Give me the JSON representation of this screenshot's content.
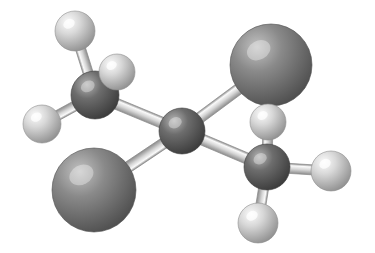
{
  "image": {
    "kind": "ball-and-stick-molecular-model",
    "title": "Ball-and-stick molecular model",
    "width": 375,
    "height": 253,
    "background_color": "#ffffff",
    "render_style": "shaded-spheres-with-cylinder-bonds",
    "light_direction": "upper-left"
  },
  "palette": {
    "background": "#ffffff",
    "halogen_base": "#8a8a8a",
    "halogen_highlight": "#c2c2c2",
    "halogen_shadow": "#4e4e4e",
    "carbon_base": "#6d6d6d",
    "carbon_highlight": "#b4b4b4",
    "carbon_shadow": "#3a3a3a",
    "hydrogen_base": "#d8d8d8",
    "hydrogen_highlight": "#fbfbfb",
    "hydrogen_shadow": "#8f8f8f",
    "bond_base": "#d5d5d5",
    "bond_highlight": "#fafafa",
    "bond_edge": "#8c8c8c"
  },
  "molecule": {
    "atom_types": [
      {
        "key": "C",
        "label": "carbon",
        "color": "#6d6d6d",
        "radius": 23
      },
      {
        "key": "X",
        "label": "halogen",
        "color": "#8a8a8a",
        "radius": 41
      },
      {
        "key": "H",
        "label": "hydrogen",
        "color": "#d8d8d8",
        "radius": 19
      }
    ],
    "atoms": [
      {
        "id": "C1",
        "element": "C",
        "name": "carbon-upper-left",
        "x": 95,
        "y": 95,
        "r": 24,
        "z": 2
      },
      {
        "id": "C2",
        "element": "C",
        "name": "carbon-center",
        "x": 182,
        "y": 131,
        "r": 23,
        "z": 3
      },
      {
        "id": "C3",
        "element": "C",
        "name": "carbon-lower-right",
        "x": 267,
        "y": 167,
        "r": 23,
        "z": 4
      },
      {
        "id": "X1",
        "element": "X",
        "name": "halogen-upper-right",
        "x": 271,
        "y": 65,
        "r": 41,
        "z": 1
      },
      {
        "id": "X2",
        "element": "X",
        "name": "halogen-lower-left",
        "x": 94,
        "y": 190,
        "r": 42,
        "z": 1
      },
      {
        "id": "H1",
        "element": "H",
        "name": "hydrogen-top-left",
        "x": 75,
        "y": 31,
        "r": 20,
        "z": 5
      },
      {
        "id": "H2",
        "element": "H",
        "name": "hydrogen-upper-mid",
        "x": 117,
        "y": 72,
        "r": 18,
        "z": 5
      },
      {
        "id": "H3",
        "element": "H",
        "name": "hydrogen-left",
        "x": 42,
        "y": 124,
        "r": 19,
        "z": 5
      },
      {
        "id": "H4",
        "element": "H",
        "name": "hydrogen-upper-right-inner",
        "x": 268,
        "y": 122,
        "r": 18,
        "z": 5
      },
      {
        "id": "H5",
        "element": "H",
        "name": "hydrogen-right",
        "x": 331,
        "y": 171,
        "r": 20,
        "z": 5
      },
      {
        "id": "H6",
        "element": "H",
        "name": "hydrogen-bottom",
        "x": 258,
        "y": 223,
        "r": 20,
        "z": 5
      }
    ],
    "bonds": [
      {
        "id": "b1",
        "name": "bond-c1-c2",
        "from": "C1",
        "to": "C2",
        "width": 11
      },
      {
        "id": "b2",
        "name": "bond-c2-c3",
        "from": "C2",
        "to": "C3",
        "width": 11
      },
      {
        "id": "b3",
        "name": "bond-c2-x1",
        "from": "C2",
        "to": "X1",
        "width": 11
      },
      {
        "id": "b4",
        "name": "bond-c2-x2",
        "from": "C2",
        "to": "X2",
        "width": 11
      },
      {
        "id": "b5",
        "name": "bond-c1-h1",
        "from": "C1",
        "to": "H1",
        "width": 10
      },
      {
        "id": "b6",
        "name": "bond-c1-h2",
        "from": "C1",
        "to": "H2",
        "width": 10
      },
      {
        "id": "b7",
        "name": "bond-c1-h3",
        "from": "C1",
        "to": "H3",
        "width": 10
      },
      {
        "id": "b8",
        "name": "bond-c3-h4",
        "from": "C3",
        "to": "H4",
        "width": 10
      },
      {
        "id": "b9",
        "name": "bond-c3-h5",
        "from": "C3",
        "to": "H5",
        "width": 10
      },
      {
        "id": "b10",
        "name": "bond-c3-h6",
        "from": "C3",
        "to": "H6",
        "width": 10
      }
    ],
    "counts": {
      "carbon": 3,
      "halogen": 2,
      "hydrogen": 6,
      "bonds": 10
    }
  }
}
